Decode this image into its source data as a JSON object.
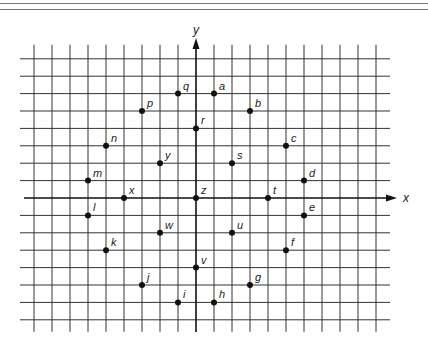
{
  "diagram": {
    "type": "coordinate-grid",
    "axes": {
      "x_label": "x",
      "y_label": "y"
    },
    "grid": {
      "columns_left_of_y_axis": 9,
      "columns_right_of_y_axis": 10,
      "rows_above_x_axis": 8,
      "rows_below_x_axis": 7
    },
    "points": [
      {
        "label": "a",
        "x": 1,
        "y": 6
      },
      {
        "label": "b",
        "x": 3,
        "y": 5
      },
      {
        "label": "c",
        "x": 5,
        "y": 3
      },
      {
        "label": "d",
        "x": 6,
        "y": 1
      },
      {
        "label": "e",
        "x": 6,
        "y": -1
      },
      {
        "label": "f",
        "x": 5,
        "y": -3
      },
      {
        "label": "g",
        "x": 3,
        "y": -5
      },
      {
        "label": "h",
        "x": 1,
        "y": -6
      },
      {
        "label": "i",
        "x": -1,
        "y": -6
      },
      {
        "label": "j",
        "x": -3,
        "y": -5
      },
      {
        "label": "k",
        "x": -5,
        "y": -3
      },
      {
        "label": "l",
        "x": -6,
        "y": -1
      },
      {
        "label": "m",
        "x": -6,
        "y": 1
      },
      {
        "label": "n",
        "x": -5,
        "y": 3
      },
      {
        "label": "p",
        "x": -3,
        "y": 5
      },
      {
        "label": "q",
        "x": -1,
        "y": 6
      },
      {
        "label": "r",
        "x": 0,
        "y": 4
      },
      {
        "label": "s",
        "x": 2,
        "y": 2
      },
      {
        "label": "t",
        "x": 4,
        "y": 0
      },
      {
        "label": "u",
        "x": 2,
        "y": -2
      },
      {
        "label": "v",
        "x": 0,
        "y": -4
      },
      {
        "label": "w",
        "x": -2,
        "y": -2
      },
      {
        "label": "x",
        "x": -4,
        "y": 0
      },
      {
        "label": "y",
        "x": -2,
        "y": 2
      },
      {
        "label": "z",
        "x": 0,
        "y": 0
      }
    ]
  }
}
